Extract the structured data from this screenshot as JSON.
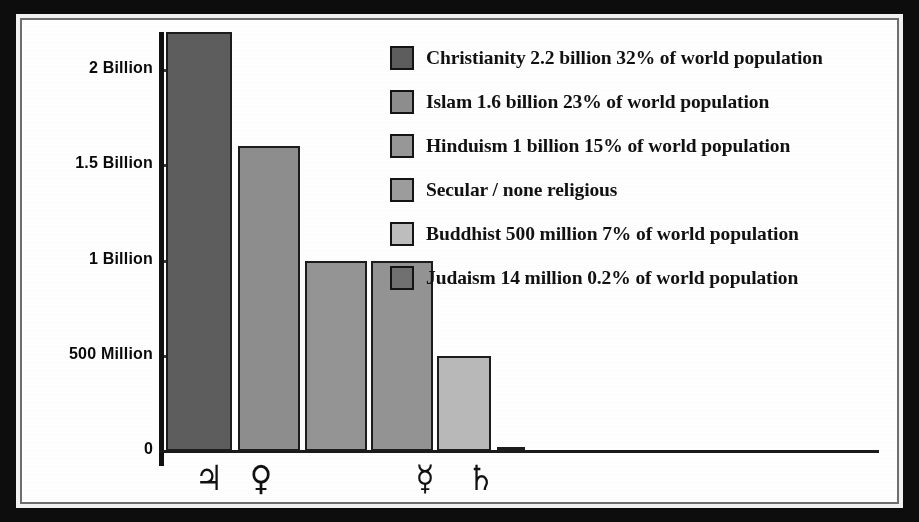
{
  "chart_data": {
    "type": "bar",
    "title": "",
    "xlabel": "",
    "ylabel": "",
    "grid": false,
    "legend_position": "inside-top-right",
    "ylim": [
      0,
      2200000000
    ],
    "y_ticks": [
      {
        "label": "2 Billion",
        "value": 2000000000
      },
      {
        "label": "1.5 Billion",
        "value": 1500000000
      },
      {
        "label": "1 Billion",
        "value": 1000000000
      },
      {
        "label": "500 Million",
        "value": 500000000
      },
      {
        "label": "0",
        "value": 0
      }
    ],
    "categories": [
      "Christianity",
      "Islam",
      "Hinduism",
      "Secular / none religious",
      "Buddhist",
      "Judaism"
    ],
    "x_tick_symbols": [
      {
        "symbol": "♃",
        "name": "jupiter-symbol"
      },
      {
        "symbol": "♀",
        "name": "venus-symbol"
      },
      {
        "symbol": "☿",
        "name": "mercury-symbol"
      },
      {
        "symbol": "♄",
        "name": "saturn-symbol"
      }
    ],
    "values": [
      2200000000,
      1600000000,
      1000000000,
      1000000000,
      500000000,
      14000000
    ],
    "value_labels": [
      "2.2 billion",
      "1.6 billion",
      "1 billion",
      "",
      "500 million",
      "14 million"
    ],
    "percent_labels": [
      "32%",
      "23%",
      "15%",
      "",
      "7%",
      "0.2%"
    ],
    "colors": [
      "#5d5d5d",
      "#8e8e8e",
      "#959595",
      "#949494",
      "#b9b9b9",
      "#6f6f6f"
    ]
  },
  "legend": {
    "items": [
      {
        "label": "Christianity 2.2 billion 32% of world population",
        "color": "#5d5d5d"
      },
      {
        "label": "Islam 1.6 billion 23% of world population",
        "color": "#8e8e8e"
      },
      {
        "label": "Hinduism 1 billion 15% of world population",
        "color": "#989898"
      },
      {
        "label": "Secular / none religious",
        "color": "#9d9d9d"
      },
      {
        "label": "Buddhist 500 million 7% of world population",
        "color": "#bebebe"
      },
      {
        "label": "Judaism 14 million 0.2% of world population",
        "color": "#707070"
      }
    ]
  },
  "axis": {
    "y_labels": [
      "2 Billion",
      "1.5 Billion",
      "1 Billion",
      "500 Million",
      "0"
    ]
  },
  "frame": {
    "border_color": "#0d0d0d",
    "background": "#ffffff"
  }
}
